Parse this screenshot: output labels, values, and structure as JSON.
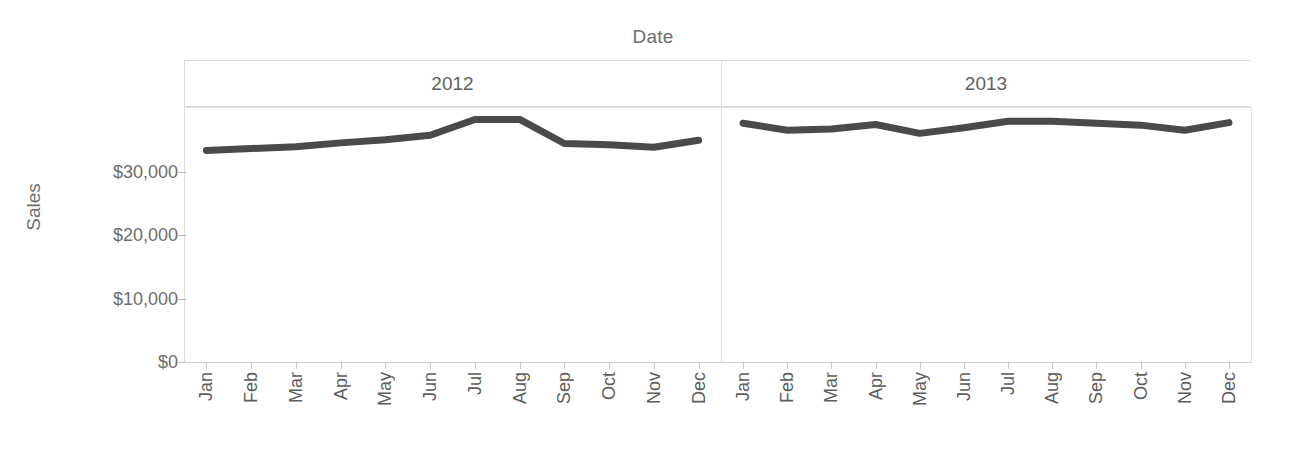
{
  "chart_data": {
    "type": "line",
    "title": "",
    "xlabel": "Date",
    "ylabel": "Sales",
    "column_field_label": "Date",
    "ylim": [
      0,
      40000
    ],
    "grid": true,
    "legend": "none",
    "line_color": "#4a4a4a",
    "axis_text_color": "#6e6e6e",
    "gridline_color": "#e3e3e1",
    "y_ticks": [
      {
        "label": "$0",
        "value": 0
      },
      {
        "label": "$10,000",
        "value": 10000
      },
      {
        "label": "$20,000",
        "value": 20000
      },
      {
        "label": "$30,000",
        "value": 30000
      }
    ],
    "categories": [
      "Jan",
      "Feb",
      "Mar",
      "Apr",
      "May",
      "Jun",
      "Jul",
      "Aug",
      "Sep",
      "Oct",
      "Nov",
      "Dec"
    ],
    "panels": [
      {
        "label": "2012",
        "values": [
          33400,
          33700,
          34000,
          34600,
          35100,
          35800,
          38300,
          38300,
          34500,
          34300,
          33900,
          35000
        ]
      },
      {
        "label": "2013",
        "values": [
          37700,
          36600,
          36800,
          37500,
          36100,
          37000,
          38000,
          38000,
          37700,
          37400,
          36600,
          37800
        ]
      }
    ]
  },
  "axes": {
    "column_title": "Date",
    "value_axis_title": "Sales"
  }
}
